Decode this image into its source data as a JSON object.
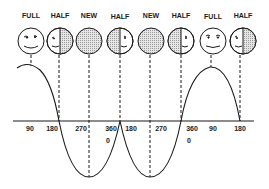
{
  "diagram": {
    "phases": [
      {
        "label": "FULL",
        "type": "full",
        "x": 31
      },
      {
        "label": "HALF",
        "type": "half-right-shaded",
        "x": 60
      },
      {
        "label": "NEW",
        "type": "new",
        "x": 89
      },
      {
        "label": "HALF",
        "type": "half-left-shaded",
        "x": 120
      },
      {
        "label": "NEW",
        "type": "new",
        "x": 151
      },
      {
        "label": "HALF",
        "type": "half-left-shaded",
        "x": 181
      },
      {
        "label": "FULL",
        "type": "full",
        "x": 213
      },
      {
        "label": "HALF",
        "type": "half-right-shaded",
        "x": 243
      }
    ],
    "axis_labels": [
      {
        "text": "90",
        "x": 30,
        "y": 130
      },
      {
        "text": "180",
        "x": 52,
        "y": 130
      },
      {
        "text": "270",
        "x": 81,
        "y": 130
      },
      {
        "text": "360",
        "x": 111,
        "y": 130
      },
      {
        "text": "0",
        "x": 108,
        "y": 142
      },
      {
        "text": "180",
        "x": 131,
        "y": 130
      },
      {
        "text": "270",
        "x": 161,
        "y": 130
      },
      {
        "text": "360",
        "x": 192,
        "y": 130
      },
      {
        "text": "0",
        "x": 189,
        "y": 142
      },
      {
        "text": "90",
        "x": 213,
        "y": 130
      },
      {
        "text": "180",
        "x": 240,
        "y": 130
      }
    ],
    "colors": {
      "ink": "#1a1a1a",
      "shade": "#c8c8c8",
      "background": "#ffffff"
    }
  }
}
